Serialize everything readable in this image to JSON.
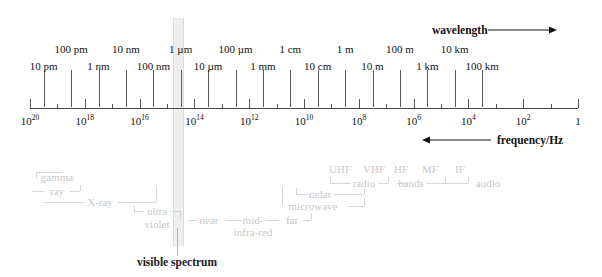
{
  "chart_data": {
    "type": "line",
    "xlabel": "frequency/Hz",
    "ylabel": "",
    "axis": {
      "orientation": "horizontal",
      "scale": "log10",
      "min_exponent": 0,
      "max_exponent": 20,
      "direction": "decreasing-left-to-right",
      "grid": false
    },
    "frequency_ticks": [
      {
        "exponent": 20,
        "label": "10",
        "sup": "20",
        "major": true
      },
      {
        "exponent": 19,
        "label": "",
        "sup": "",
        "major": false
      },
      {
        "exponent": 18,
        "label": "10",
        "sup": "18",
        "major": true
      },
      {
        "exponent": 17,
        "label": "",
        "sup": "",
        "major": false
      },
      {
        "exponent": 16,
        "label": "10",
        "sup": "16",
        "major": true
      },
      {
        "exponent": 15,
        "label": "",
        "sup": "",
        "major": false
      },
      {
        "exponent": 14,
        "label": "10",
        "sup": "14",
        "major": true
      },
      {
        "exponent": 13,
        "label": "",
        "sup": "",
        "major": false
      },
      {
        "exponent": 12,
        "label": "10",
        "sup": "12",
        "major": true
      },
      {
        "exponent": 11,
        "label": "",
        "sup": "",
        "major": false
      },
      {
        "exponent": 10,
        "label": "10",
        "sup": "10",
        "major": true
      },
      {
        "exponent": 9,
        "label": "",
        "sup": "",
        "major": false
      },
      {
        "exponent": 8,
        "label": "10",
        "sup": "8",
        "major": true
      },
      {
        "exponent": 7,
        "label": "",
        "sup": "",
        "major": false
      },
      {
        "exponent": 6,
        "label": "10",
        "sup": "6",
        "major": true
      },
      {
        "exponent": 5,
        "label": "",
        "sup": "",
        "major": false
      },
      {
        "exponent": 4,
        "label": "10",
        "sup": "4",
        "major": true
      },
      {
        "exponent": 3,
        "label": "",
        "sup": "",
        "major": false
      },
      {
        "exponent": 2,
        "label": "10",
        "sup": "2",
        "major": true
      },
      {
        "exponent": 1,
        "label": "",
        "sup": "",
        "major": false
      },
      {
        "exponent": 0,
        "label": "1",
        "sup": "",
        "major": true
      }
    ],
    "wavelength_labels": [
      {
        "text": "10 pm",
        "exponent": 19.5,
        "row": "lower"
      },
      {
        "text": "100 pm",
        "exponent": 18.5,
        "row": "upper"
      },
      {
        "text": "1 nm",
        "exponent": 17.5,
        "row": "lower"
      },
      {
        "text": "10 nm",
        "exponent": 16.5,
        "row": "upper"
      },
      {
        "text": "100 nm",
        "exponent": 15.5,
        "row": "lower"
      },
      {
        "text": "1 µm",
        "exponent": 14.5,
        "row": "upper"
      },
      {
        "text": "10 µm",
        "exponent": 13.5,
        "row": "lower"
      },
      {
        "text": "100 µm",
        "exponent": 12.5,
        "row": "upper"
      },
      {
        "text": "1 mm",
        "exponent": 11.5,
        "row": "lower"
      },
      {
        "text": "1 cm",
        "exponent": 10.5,
        "row": "upper"
      },
      {
        "text": "10 cm",
        "exponent": 9.5,
        "row": "lower"
      },
      {
        "text": "1 m",
        "exponent": 8.5,
        "row": "upper"
      },
      {
        "text": "10 m",
        "exponent": 7.5,
        "row": "lower"
      },
      {
        "text": "100 m",
        "exponent": 6.5,
        "row": "upper"
      },
      {
        "text": "1 km",
        "exponent": 5.5,
        "row": "lower"
      },
      {
        "text": "10 km",
        "exponent": 4.5,
        "row": "upper"
      },
      {
        "text": "100 km",
        "exponent": 3.5,
        "row": "lower"
      }
    ],
    "annotations": {
      "wavelength_arrow": "wavelength",
      "frequency_arrow": "frequency/Hz",
      "visible_spectrum": "visible spectrum"
    },
    "bands": [
      {
        "name": "gamma ray",
        "line1": "gamma",
        "line2": "ray"
      },
      {
        "name": "X-ray",
        "line1": "X-ray",
        "line2": ""
      },
      {
        "name": "ultra violet",
        "line1": "ultra",
        "line2": "violet"
      },
      {
        "name": "near infra-red",
        "line1": "near",
        "line2": ""
      },
      {
        "name": "mid infra-red",
        "line1": "mid-",
        "line2": "infra-red"
      },
      {
        "name": "far infra-red",
        "line1": "far",
        "line2": ""
      },
      {
        "name": "microwave",
        "line1": "microwave",
        "line2": ""
      },
      {
        "name": "radar",
        "line1": "radar",
        "line2": ""
      },
      {
        "name": "radio bands",
        "line1": "radio",
        "line2": "bands"
      },
      {
        "name": "UHF",
        "line1": "UHF",
        "line2": ""
      },
      {
        "name": "VHF",
        "line1": "VHF",
        "line2": ""
      },
      {
        "name": "HF",
        "line1": "HF",
        "line2": ""
      },
      {
        "name": "MF",
        "line1": "MF",
        "line2": ""
      },
      {
        "name": "IF",
        "line1": "IF",
        "line2": ""
      },
      {
        "name": "audio",
        "line1": "audio",
        "line2": ""
      }
    ],
    "colors": {
      "axis": "#4a4a4a",
      "text": "#111111",
      "annotation_gray": "#c9c9c9",
      "visible_band": "#eeeeee"
    }
  },
  "labels": {
    "wavelength_arrow": "wavelength",
    "frequency_arrow": "frequency/Hz",
    "visible_spectrum": "visible spectrum",
    "gamma": "gamma",
    "ray": "ray",
    "xray": "X-ray",
    "ultra": "ultra",
    "violet": "violet",
    "near": "near",
    "mid": "mid-",
    "infrared": "infra-red",
    "far": "far",
    "microwave": "microwave",
    "radar": "radar",
    "radio": "radio",
    "bands": "bands",
    "uhf": "UHF",
    "vhf": "VHF",
    "hf": "HF",
    "mf": "MF",
    "if": "IF",
    "audio": "audio"
  }
}
